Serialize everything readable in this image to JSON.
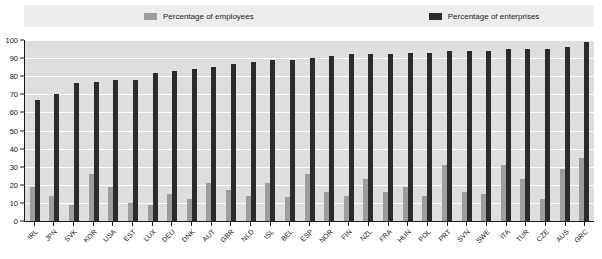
{
  "legend": {
    "items": [
      {
        "label": "Percentage of employees",
        "icon": "legend-swatch-grey",
        "color": "#9d9d9d"
      },
      {
        "label": "Percentage of enterprises",
        "icon": "legend-swatch-black",
        "color": "#2b2b2b"
      }
    ]
  },
  "chart_data": {
    "type": "bar",
    "title": "",
    "xlabel": "",
    "ylabel": "",
    "ylim": [
      0,
      100
    ],
    "yticks": [
      0,
      10,
      20,
      30,
      40,
      50,
      60,
      70,
      80,
      90,
      100
    ],
    "grid": true,
    "legend_position": "top",
    "categories": [
      "IRL",
      "JPN",
      "SVK",
      "KOR",
      "USA",
      "EST",
      "LUX",
      "DEU",
      "DNK",
      "AUT",
      "GBR",
      "NLD",
      "ISL",
      "BEL",
      "ESP",
      "NOR",
      "FIN",
      "NZL",
      "FRA",
      "HUN",
      "POL",
      "PRT",
      "SVN",
      "SWE",
      "ITA",
      "TUR",
      "CZE",
      "AUS",
      "GRC"
    ],
    "series": [
      {
        "name": "Percentage of employees",
        "color": "#9d9d9d",
        "values": [
          19,
          14,
          9,
          26,
          19,
          10,
          9,
          15,
          12,
          21,
          17,
          14,
          21,
          13,
          26,
          16,
          14,
          23,
          16,
          19,
          14,
          31,
          16,
          15,
          31,
          23,
          12,
          29,
          35
        ]
      },
      {
        "name": "Percentage of enterprises",
        "color": "#2b2b2b",
        "values": [
          67,
          70,
          76,
          77,
          78,
          78,
          82,
          83,
          84,
          85,
          87,
          88,
          89,
          89,
          90,
          91,
          92,
          92,
          92,
          93,
          93,
          94,
          94,
          94,
          95,
          95,
          95,
          96,
          99
        ]
      }
    ]
  }
}
